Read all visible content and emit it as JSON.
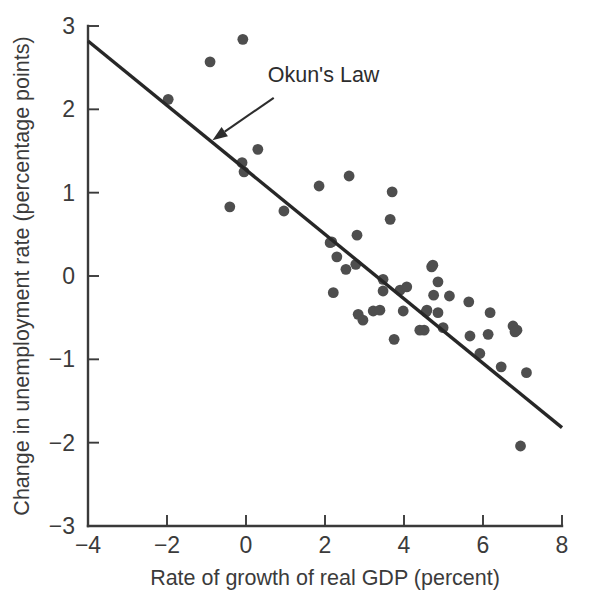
{
  "chart_data": {
    "type": "scatter",
    "title": "",
    "xlabel": "Rate of growth of real GDP (percent)",
    "ylabel": "Change in unemployment rate (percentage points)",
    "xlim": [
      -4,
      8
    ],
    "ylim": [
      -3,
      3
    ],
    "xticks": [
      -4,
      -2,
      0,
      2,
      4,
      6,
      8
    ],
    "yticks": [
      -3,
      -2,
      -1,
      0,
      1,
      2,
      3
    ],
    "xticklabels": [
      "−4",
      "−2",
      "0",
      "2",
      "4",
      "6",
      "8"
    ],
    "yticklabels": [
      "−3",
      "−2",
      "−1",
      "0",
      "1",
      "2",
      "3"
    ],
    "grid": false,
    "legend": false,
    "annotations": [
      {
        "text": "Okun's Law",
        "kind": "arrow-label",
        "label_x": 0.55,
        "label_y": 2.33,
        "arrow_tip_x": -0.85,
        "arrow_tip_y": 1.63
      }
    ],
    "series": [
      {
        "name": "Okun's Law fit line",
        "type": "line",
        "x": [
          -4.0,
          8.0
        ],
        "y": [
          2.82,
          -1.82
        ],
        "color": "#272727"
      },
      {
        "name": "Annual observations",
        "type": "scatter",
        "color": "#4e4e4e",
        "marker_size_px": 5.4,
        "points": [
          [
            -1.97,
            2.12
          ],
          [
            -0.91,
            2.57
          ],
          [
            -0.08,
            2.84
          ],
          [
            -0.1,
            1.36
          ],
          [
            -0.05,
            1.25
          ],
          [
            0.3,
            1.52
          ],
          [
            -0.41,
            0.83
          ],
          [
            0.96,
            0.78
          ],
          [
            1.85,
            1.08
          ],
          [
            2.61,
            1.2
          ],
          [
            3.7,
            1.01
          ],
          [
            3.65,
            0.68
          ],
          [
            2.17,
            0.41
          ],
          [
            2.81,
            0.49
          ],
          [
            2.3,
            0.23
          ],
          [
            2.13,
            0.4
          ],
          [
            2.53,
            0.08
          ],
          [
            2.78,
            0.14
          ],
          [
            2.21,
            -0.2
          ],
          [
            3.47,
            -0.04
          ],
          [
            3.47,
            -0.18
          ],
          [
            3.9,
            -0.17
          ],
          [
            4.07,
            -0.13
          ],
          [
            4.7,
            0.11
          ],
          [
            4.73,
            0.13
          ],
          [
            4.86,
            -0.07
          ],
          [
            4.75,
            -0.23
          ],
          [
            5.15,
            -0.24
          ],
          [
            5.64,
            -0.31
          ],
          [
            2.84,
            -0.46
          ],
          [
            2.96,
            -0.53
          ],
          [
            3.22,
            -0.42
          ],
          [
            3.39,
            -0.41
          ],
          [
            3.98,
            -0.42
          ],
          [
            4.56,
            -0.43
          ],
          [
            4.58,
            -0.41
          ],
          [
            6.18,
            -0.44
          ],
          [
            4.86,
            -0.44
          ],
          [
            4.51,
            -0.65
          ],
          [
            4.4,
            -0.65
          ],
          [
            4.99,
            -0.62
          ],
          [
            6.76,
            -0.6
          ],
          [
            6.86,
            -0.65
          ],
          [
            3.75,
            -0.76
          ],
          [
            5.67,
            -0.72
          ],
          [
            6.13,
            -0.7
          ],
          [
            6.81,
            -0.67
          ],
          [
            5.92,
            -0.93
          ],
          [
            6.46,
            -1.09
          ],
          [
            7.1,
            -1.16
          ],
          [
            6.95,
            -2.04
          ]
        ]
      }
    ]
  }
}
